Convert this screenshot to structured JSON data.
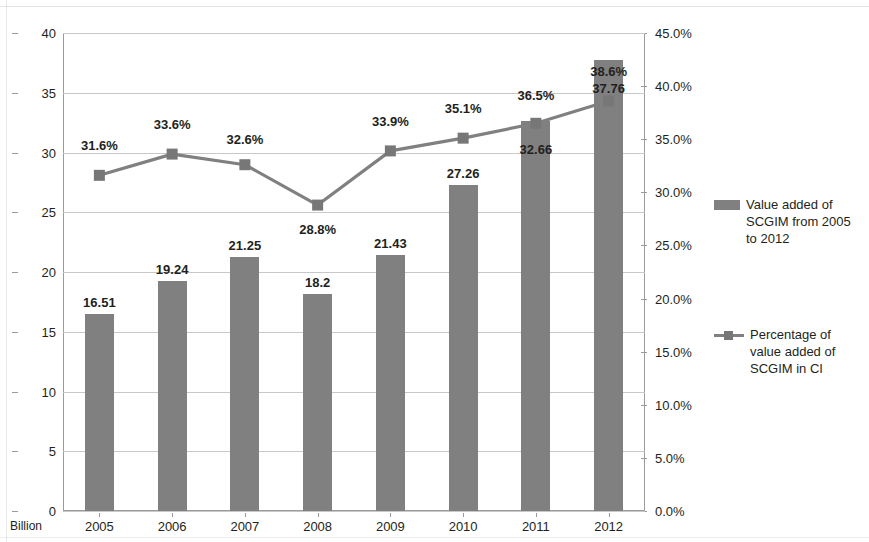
{
  "chart_data": {
    "type": "bar",
    "title": "",
    "subtitle": "",
    "xlabel": "",
    "ylabel": "Billion",
    "y2label": "",
    "unit_note": "Billion",
    "categories": [
      "2005",
      "2006",
      "2007",
      "2008",
      "2009",
      "2010",
      "2011",
      "2012"
    ],
    "ylim": [
      0,
      40
    ],
    "y2lim": [
      0,
      45
    ],
    "yticks": [
      "0",
      "5",
      "10",
      "15",
      "20",
      "25",
      "30",
      "35",
      "40"
    ],
    "ytick_values": [
      0,
      5,
      10,
      15,
      20,
      25,
      30,
      35,
      40
    ],
    "y2ticks": [
      "0.0%",
      "5.0%",
      "10.0%",
      "15.0%",
      "20.0%",
      "25.0%",
      "30.0%",
      "35.0%",
      "40.0%",
      "45.0%"
    ],
    "y2tick_values": [
      0,
      5,
      10,
      15,
      20,
      25,
      30,
      35,
      40,
      45
    ],
    "grid": true,
    "legend_position": "right",
    "series": [
      {
        "name": "Value added of SCGIM from 2005 to 2012",
        "type": "bar",
        "axis": "left",
        "color": "#808080",
        "values": [
          16.51,
          19.24,
          21.25,
          18.2,
          21.43,
          27.26,
          32.66,
          37.76
        ],
        "labels": [
          "16.51",
          "19.24",
          "21.25",
          "18.2",
          "21.43",
          "27.26",
          "32.66",
          "37.76"
        ],
        "label_inside": [
          false,
          false,
          false,
          false,
          false,
          false,
          true,
          true
        ]
      },
      {
        "name": "Percentage of value added of SCGIM in CI",
        "type": "line",
        "axis": "right",
        "color": "#808080",
        "values": [
          31.6,
          33.6,
          32.6,
          28.8,
          33.9,
          35.1,
          36.5,
          38.6
        ],
        "labels": [
          "31.6%",
          "33.6%",
          "32.6%",
          "28.8%",
          "33.9%",
          "35.1%",
          "36.5%",
          "38.6%"
        ]
      }
    ]
  },
  "legend": {
    "entries": [
      {
        "label": "Value added of SCGIM from 2005 to 2012",
        "marker": "bar-swatch",
        "color": "#808080"
      },
      {
        "label": "Percentage of value added of SCGIM in CI",
        "marker": "line-swatch",
        "color": "#808080"
      }
    ]
  },
  "axis_unit": {
    "left": "Billion"
  },
  "colors": {
    "bar": "#808080",
    "line": "#808080",
    "grid": "#c8c8c8",
    "axis": "#9a9a9a",
    "text": "#231f20",
    "background": "#ffffff"
  }
}
